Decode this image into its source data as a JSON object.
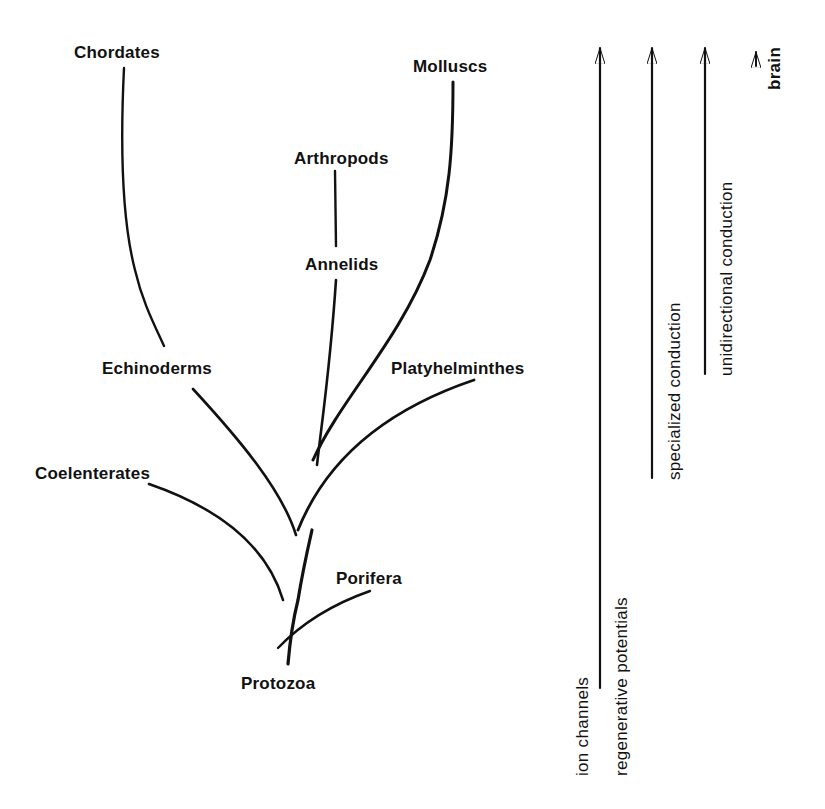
{
  "diagram": {
    "type": "phylogenetic-tree",
    "taxa": [
      {
        "id": "chordates",
        "label": "Chordates"
      },
      {
        "id": "molluscs",
        "label": "Molluscs"
      },
      {
        "id": "arthropods",
        "label": "Arthropods"
      },
      {
        "id": "annelids",
        "label": "Annelids"
      },
      {
        "id": "echinoderms",
        "label": "Echinoderms"
      },
      {
        "id": "platyhelminthes",
        "label": "Platyhelminthes"
      },
      {
        "id": "coelenterates",
        "label": "Coelenterates"
      },
      {
        "id": "porifera",
        "label": "Porifera"
      },
      {
        "id": "protozoa",
        "label": "Protozoa"
      }
    ],
    "edges": [
      [
        "protozoa",
        "porifera"
      ],
      [
        "protozoa",
        "coelenterates"
      ],
      [
        "protozoa",
        "echinoderms"
      ],
      [
        "echinoderms",
        "chordates"
      ],
      [
        "protozoa",
        "platyhelminthes"
      ],
      [
        "protozoa",
        "annelids"
      ],
      [
        "annelids",
        "arthropods"
      ],
      [
        "protozoa",
        "molluscs"
      ]
    ],
    "features": [
      {
        "id": "ion-channels",
        "label": "ion channels",
        "arrow": true
      },
      {
        "id": "regenerative-potentials",
        "label": "regenerative potentials",
        "arrow": true
      },
      {
        "id": "specialized-conduction",
        "label": "specialized conduction",
        "arrow": true
      },
      {
        "id": "unidirectional-conduction",
        "label": "unidirectional conduction",
        "arrow": true
      },
      {
        "id": "brain",
        "label": "brain",
        "arrow": true
      }
    ]
  },
  "labels": {
    "chordates": "Chordates",
    "molluscs": "Molluscs",
    "arthropods": "Arthropods",
    "annelids": "Annelids",
    "echinoderms": "Echinoderms",
    "platyhelminthes": "Platyhelminthes",
    "coelenterates": "Coelenterates",
    "porifera": "Porifera",
    "protozoa": "Protozoa",
    "ion_channels": "ion channels",
    "regenerative_potentials": "regenerative potentials",
    "specialized_conduction": "specialized conduction",
    "unidirectional_conduction": "unidirectional conduction",
    "brain": "brain"
  }
}
